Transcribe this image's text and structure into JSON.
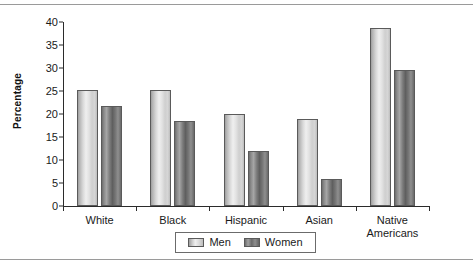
{
  "chart_data": {
    "type": "bar",
    "title": "",
    "subtitle": "",
    "xlabel": "",
    "ylabel": "Percentage",
    "ylim": [
      0,
      40
    ],
    "ytick_step": 5,
    "yticks": [
      "40",
      "35",
      "30",
      "25",
      "20",
      "15",
      "10",
      "5",
      "0"
    ],
    "grid": false,
    "legend_position": "bottom-center",
    "categories": [
      "White",
      "Black",
      "Hispanic",
      "Asian",
      "Native Americans"
    ],
    "category_lines": [
      [
        "White"
      ],
      [
        "Black"
      ],
      [
        "Hispanic"
      ],
      [
        "Asian"
      ],
      [
        "Native",
        "Americans"
      ]
    ],
    "series": [
      {
        "name": "Men",
        "values": [
          25.3,
          25.3,
          20.1,
          19.0,
          38.6
        ]
      },
      {
        "name": "Women",
        "values": [
          21.7,
          18.4,
          12.0,
          5.8,
          29.6
        ]
      }
    ]
  },
  "legend": {
    "items": [
      {
        "label": "Men"
      },
      {
        "label": "Women"
      }
    ]
  },
  "colors": {
    "men_bar": "#d8d8d8",
    "women_bar": "#7d7d7d",
    "axis": "#2b2b2b",
    "text": "#1a1a1a",
    "rule": "#9a9a9a",
    "background": "#ffffff"
  }
}
